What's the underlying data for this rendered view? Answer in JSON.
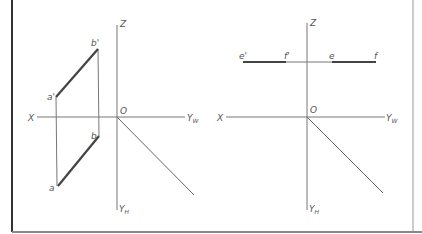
{
  "colors": {
    "axis": "#777777",
    "projection": "#444444",
    "border_left": "#333333",
    "border": "#888888",
    "label": "#555555"
  },
  "diagrams": [
    {
      "name": "line-ab",
      "axis_labels": {
        "x": "X",
        "z": "Z",
        "origin": "O",
        "yw": "Y",
        "yw_sub": "W",
        "yh": "Y",
        "yh_sub": "H"
      },
      "points": {
        "a_prime": {
          "label": "a'",
          "x": 56,
          "y": 97
        },
        "b_prime": {
          "label": "b'",
          "x": 98,
          "y": 49
        },
        "a": {
          "label": "a",
          "x": 58,
          "y": 186
        },
        "b": {
          "label": "b",
          "x": 99,
          "y": 136
        }
      }
    },
    {
      "name": "line-ef",
      "axis_labels": {
        "x": "X",
        "z": "Z",
        "origin": "O",
        "yw": "Y",
        "yw_sub": "W",
        "yh": "Y",
        "yh_sub": "H"
      },
      "points": {
        "e_prime": {
          "label": "e'",
          "x": 243,
          "y": 62
        },
        "f_prime": {
          "label": "f'",
          "x": 286,
          "y": 62
        },
        "e": {
          "label": "e",
          "x": 332,
          "y": 62
        },
        "f": {
          "label": "f",
          "x": 376,
          "y": 62
        }
      }
    }
  ]
}
